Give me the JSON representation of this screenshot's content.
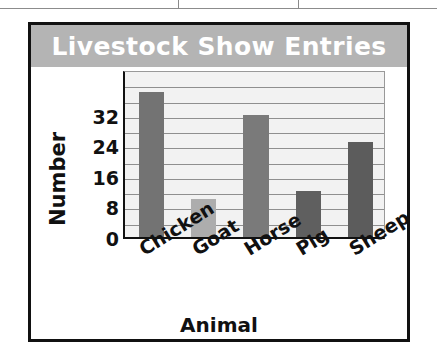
{
  "table_strip": {
    "divider_positions": [
      178,
      298
    ]
  },
  "chart_data": {
    "type": "bar",
    "title": "Livestock Show Entries",
    "xlabel": "Animal",
    "ylabel": "Number",
    "categories": [
      "Chicken",
      "Goat",
      "Horse",
      "Pig",
      "Sheep"
    ],
    "values": [
      38,
      10,
      32,
      12,
      25
    ],
    "ylim": [
      0,
      44
    ],
    "yticks": [
      0,
      8,
      16,
      24,
      32
    ],
    "ytick_labels": [
      "0",
      "8",
      "16",
      "24",
      "32"
    ],
    "gridline_interval": 4,
    "grid": true,
    "legend": "none",
    "bar_colors": [
      "#737373",
      "#adadad",
      "#7a7a7a",
      "#5f5f5f",
      "#5c5c5c"
    ],
    "title_band_color": "#b4b4b4",
    "title_text_color": "#ffffff",
    "plot_background": "#f2f2f2",
    "gridline_color": "#8f8f8f",
    "axis_color": "#111111",
    "category_label_rotation": -32
  }
}
